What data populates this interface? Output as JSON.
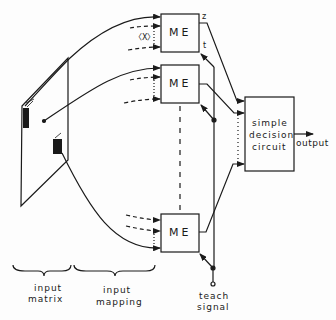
{
  "diagram": {
    "modules": [
      {
        "id": "me1",
        "label": "ME",
        "x": 161,
        "y": 14,
        "w": 38,
        "h": 38
      },
      {
        "id": "me2",
        "label": "ME",
        "x": 161,
        "y": 65,
        "w": 38,
        "h": 38
      },
      {
        "id": "me3",
        "label": "ME",
        "x": 161,
        "y": 214,
        "w": 38,
        "h": 38
      }
    ],
    "input_vector_label": "〈X〉",
    "outputs": {
      "z": "z",
      "t": "t"
    },
    "decision": {
      "line1": "simple",
      "line2": "decision",
      "line3": "circuit"
    },
    "output_label": "output",
    "teach": {
      "line1": "teach",
      "line2": "signal"
    },
    "braces": [
      {
        "line1": "input",
        "line2": "matrix"
      },
      {
        "line1": "input",
        "line2": "mapping"
      }
    ],
    "colors": {
      "ink": "#1a1a1a",
      "background": "#fdfdfd"
    }
  }
}
